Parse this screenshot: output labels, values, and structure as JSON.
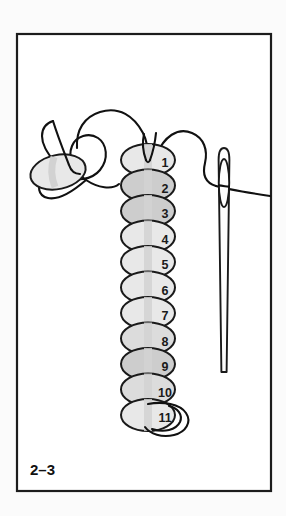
{
  "figure": {
    "label": "2–3",
    "frame": {
      "x": 17,
      "y": 34,
      "width": 254,
      "height": 457,
      "stroke_color": "#1c1c1c",
      "stroke_width": 2.2,
      "fill_color": "#ffffff"
    },
    "canvas": {
      "width": 286,
      "height": 516,
      "background_color": "#fbfbfb"
    }
  },
  "palette": {
    "thread_color": "#111111",
    "bead_outline": "#1a1a1a",
    "bead_light": "#e8e8e8",
    "bead_mid": "#dcdcdc",
    "bead_dark": "#cdcdcd",
    "channel_color": "#d2d2d2",
    "needle_color": "#1a1a1a",
    "number_color": "#1a1a1a"
  },
  "bead_column": {
    "name": "bead-stack",
    "count": 11,
    "center_x": 148,
    "first_center_y": 160,
    "spacing_y": 25.5,
    "radius_x": 27,
    "radius_y": 16,
    "number_offset_x": 17,
    "beads": [
      {
        "number": "1",
        "cy": 160.0,
        "shade": "light"
      },
      {
        "number": "2",
        "cy": 185.5,
        "shade": "dark"
      },
      {
        "number": "3",
        "cy": 211.0,
        "shade": "dark"
      },
      {
        "number": "4",
        "cy": 236.5,
        "shade": "light"
      },
      {
        "number": "5",
        "cy": 262.0,
        "shade": "light"
      },
      {
        "number": "6",
        "cy": 287.5,
        "shade": "light"
      },
      {
        "number": "7",
        "cy": 313.0,
        "shade": "light"
      },
      {
        "number": "8",
        "cy": 338.5,
        "shade": "mid"
      },
      {
        "number": "9",
        "cy": 364.0,
        "shade": "dark"
      },
      {
        "number": "10",
        "cy": 389.5,
        "shade": "mid"
      },
      {
        "number": "11",
        "cy": 415.0,
        "shade": "light"
      }
    ]
  },
  "stop_bead": {
    "name": "stop-bead",
    "cx": 58,
    "cy": 172,
    "radius_x": 28,
    "radius_y": 17,
    "rotation_deg": -12,
    "shade": "light"
  },
  "needle": {
    "name": "beading-needle",
    "top_y": 148,
    "tip_y": 372,
    "shaft_x": 224,
    "eye": {
      "cx": 224,
      "cy": 183,
      "radius_x": 5.2,
      "radius_y": 24
    }
  },
  "threads": [
    {
      "name": "thread-tail-left",
      "description": "free thread tail curving up from the stop bead"
    },
    {
      "name": "thread-loop-stop-bead",
      "description": "thread wrapped around the stop bead"
    },
    {
      "name": "thread-arc-to-column",
      "description": "long arc from stop bead over to bead 1"
    },
    {
      "name": "thread-over-bead-one",
      "description": "thread entering the top of bead 1"
    },
    {
      "name": "thread-to-needle",
      "description": "working thread running from bead 1 to the needle eye"
    },
    {
      "name": "thread-through-eye",
      "description": "thread passing through the needle eye and off to the right"
    },
    {
      "name": "thread-loop-bead-eleven",
      "description": "thread loop wrapping the bottom bead 11"
    }
  ],
  "accessibility": {
    "alt": "Beading diagram: a vertical column of eleven numbered beads with a stop bead and thread loop at the left and a threaded needle at the right."
  }
}
